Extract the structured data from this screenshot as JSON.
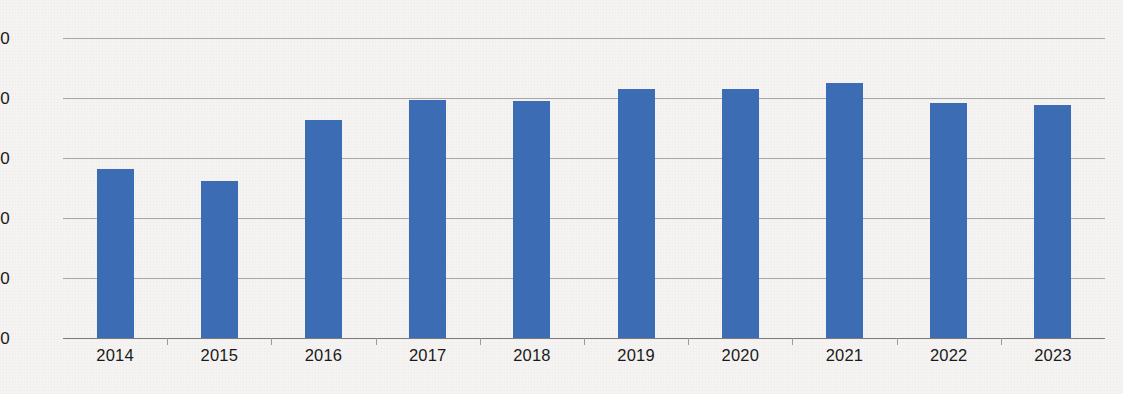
{
  "chart_data": {
    "type": "bar",
    "title": "",
    "subtitle": "",
    "xlabel": "",
    "ylabel": "",
    "categories": [
      "2014",
      "2015",
      "2016",
      "2017",
      "2018",
      "2019",
      "2020",
      "2021",
      "2022",
      "2023"
    ],
    "values": [
      282,
      262,
      363,
      397,
      395,
      415,
      415,
      425,
      392,
      388
    ],
    "series": [
      {
        "name": "",
        "values": [
          282,
          262,
          363,
          397,
          395,
          415,
          415,
          425,
          392,
          388
        ]
      }
    ],
    "ylim": [
      0,
      500
    ],
    "ytick_labels": [
      "0",
      "100",
      "200",
      "300",
      "400",
      "500"
    ],
    "ytick_values": [
      0,
      100,
      200,
      300,
      400,
      500
    ],
    "grid": true,
    "grid_axis": "y",
    "legend": false,
    "legend_position": "none",
    "bar_color": "#3c6cb3",
    "background_color": "#f5f4f2",
    "gridline_color": "#8e8e8e",
    "axis_color": "#7a7a7a",
    "text_color": "#1a1a1a",
    "annotations": []
  },
  "axis": {
    "y_ticks": [
      {
        "label": "500",
        "value": 500
      },
      {
        "label": "400",
        "value": 400
      },
      {
        "label": "300",
        "value": 300
      },
      {
        "label": "200",
        "value": 200
      },
      {
        "label": "100",
        "value": 100
      },
      {
        "label": "0",
        "value": 0
      }
    ],
    "x_ticks": [
      {
        "label": "2014",
        "value": 282
      },
      {
        "label": "2015",
        "value": 262
      },
      {
        "label": "2016",
        "value": 363
      },
      {
        "label": "2017",
        "value": 397
      },
      {
        "label": "2018",
        "value": 395
      },
      {
        "label": "2019",
        "value": 415
      },
      {
        "label": "2020",
        "value": 415
      },
      {
        "label": "2021",
        "value": 425
      },
      {
        "label": "2022",
        "value": 392
      },
      {
        "label": "2023",
        "value": 388
      }
    ]
  }
}
